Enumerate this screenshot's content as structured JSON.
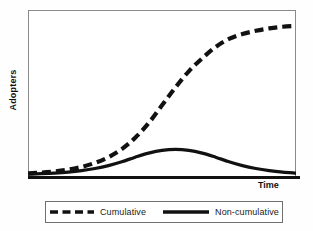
{
  "chart_data": {
    "type": "line",
    "title": "",
    "subtitle": "",
    "xlabel": "Time",
    "ylabel": "Adopters",
    "xlim": [
      0,
      100
    ],
    "ylim": [
      0,
      100
    ],
    "grid": false,
    "axis_ticks": {
      "x": [],
      "y": []
    },
    "legend_position": "bottom-outside",
    "annotations": [],
    "x": [
      0,
      5,
      10,
      15,
      20,
      25,
      30,
      35,
      40,
      45,
      50,
      55,
      60,
      65,
      70,
      75,
      80,
      85,
      90,
      95,
      100
    ],
    "series": [
      {
        "name": "Cumulative",
        "style": "dashed",
        "color": "#111111",
        "values": [
          1,
          1.5,
          2.2,
          3.3,
          5,
          7.5,
          11,
          16,
          23,
          32,
          43,
          54,
          64,
          72,
          79,
          84,
          87,
          89,
          90.5,
          91.5,
          92
        ]
      },
      {
        "name": "Non-cumulative",
        "style": "solid",
        "color": "#111111",
        "values": [
          0.5,
          0.8,
          1.2,
          1.8,
          2.7,
          4,
          5.8,
          8.2,
          11,
          13.5,
          15.2,
          15.8,
          15.2,
          13.5,
          11,
          8.2,
          5.8,
          4,
          2.7,
          1.8,
          1.2
        ]
      }
    ]
  },
  "legend": {
    "entries": [
      {
        "label": "Cumulative",
        "style": "dashed"
      },
      {
        "label": "Non-cumulative",
        "style": "solid"
      }
    ]
  },
  "axes": {
    "x_title": "Time",
    "y_title": "Adopters"
  }
}
